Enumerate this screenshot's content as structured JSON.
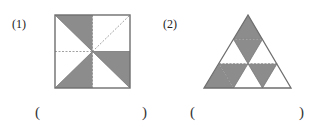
{
  "problems": [
    {
      "label": "(1)",
      "figure": "square",
      "description": "Square divided by dashed midlines and diagonals into 8 congruent right triangles",
      "total_parts": 8,
      "shaded_parts": 3,
      "answer_open": "(",
      "answer_close": ")",
      "answer_value": ""
    },
    {
      "label": "(2)",
      "figure": "triangle",
      "description": "Equilateral triangle divided into 9 congruent small triangles",
      "total_parts": 9,
      "shaded_parts": 5,
      "answer_open": "(",
      "answer_close": ")",
      "answer_value": ""
    }
  ],
  "colors": {
    "shade": "#8c8c8c",
    "outline": "#6e6e6e",
    "dashed": "#8a8a8a"
  }
}
